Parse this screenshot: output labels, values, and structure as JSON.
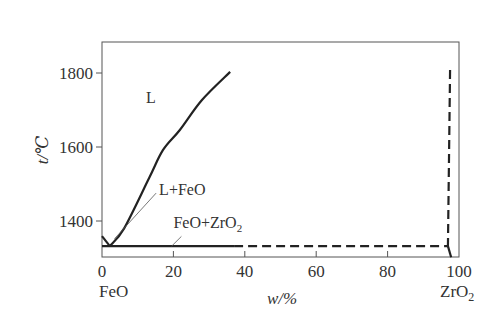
{
  "chart_data": {
    "type": "line",
    "title": "",
    "xlabel": "w/%",
    "ylabel": "t/℃",
    "xlim": [
      0,
      100
    ],
    "ylim": [
      1300,
      1880
    ],
    "x_ticks": [
      0,
      20,
      40,
      60,
      80,
      100
    ],
    "x_tick_labels": [
      "0",
      "20",
      "40",
      "60",
      "80",
      "100"
    ],
    "y_ticks": [
      1400,
      1600,
      1800
    ],
    "y_tick_labels": [
      "1400",
      "1600",
      "1800"
    ],
    "x_end_labels": {
      "left": "FeO",
      "right": "ZrO2"
    },
    "grid": false,
    "legend": "none",
    "series": [
      {
        "name": "FeO liquidus",
        "style": "solid",
        "points": [
          [
            0,
            1359
          ],
          [
            2.2,
            1332
          ]
        ]
      },
      {
        "name": "ZrO2 liquidus",
        "style": "solid",
        "points": [
          [
            2.2,
            1332
          ],
          [
            6.2,
            1380
          ],
          [
            13.2,
            1516
          ],
          [
            17.1,
            1592
          ],
          [
            21.8,
            1646
          ],
          [
            28.0,
            1727
          ],
          [
            35.9,
            1803
          ]
        ]
      },
      {
        "name": "eutectic line (solid)",
        "style": "solid",
        "points": [
          [
            0,
            1332
          ],
          [
            37,
            1332
          ]
        ]
      },
      {
        "name": "eutectic line (dashed)",
        "style": "dashed",
        "points": [
          [
            37,
            1332
          ],
          [
            96.9,
            1332
          ]
        ]
      },
      {
        "name": "ZrO2-rich boundary",
        "style": "dashed",
        "points": [
          [
            97.5,
            1808
          ],
          [
            96.9,
            1332
          ]
        ]
      },
      {
        "name": "ZrO2-rich boundary (lower)",
        "style": "solid",
        "points": [
          [
            96.9,
            1332
          ],
          [
            97.8,
            1302
          ]
        ]
      }
    ],
    "annotations": [
      {
        "text": "L",
        "x": 12.3,
        "y": 1720
      },
      {
        "text": "L+FeO",
        "x": 16,
        "y": 1470,
        "leader_to": [
          3.5,
          1352
        ]
      },
      {
        "text": "FeO+ZrO2",
        "x": 20,
        "y": 1380,
        "leader_to": [
          19.5,
          1332
        ]
      }
    ]
  }
}
